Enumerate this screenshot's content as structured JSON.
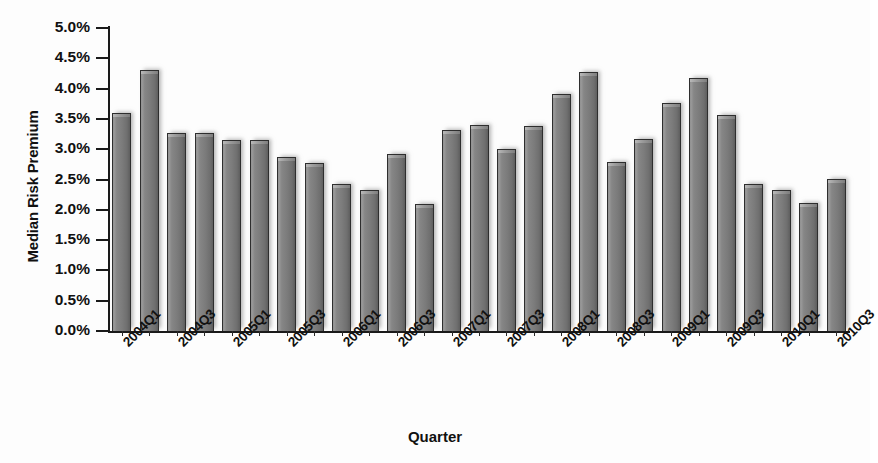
{
  "chart_data": {
    "type": "bar",
    "title": "",
    "xlabel": "Quarter",
    "ylabel": "Median Risk Premium",
    "ylim": [
      0.0,
      5.0
    ],
    "ytick_values": [
      0.0,
      0.5,
      1.0,
      1.5,
      2.0,
      2.5,
      3.0,
      3.5,
      4.0,
      4.5,
      5.0
    ],
    "ytick_labels": [
      "0.0%",
      "0.5%",
      "1.0%",
      "1.5%",
      "2.0%",
      "2.5%",
      "3.0%",
      "3.5%",
      "4.0%",
      "4.5%",
      "5.0%"
    ],
    "grid": false,
    "legend": false,
    "units": "percent",
    "categories": [
      "2004Q1",
      "2004Q2",
      "2004Q3",
      "2004Q4",
      "2005Q1",
      "2005Q2",
      "2005Q3",
      "2005Q4",
      "2006Q1",
      "2006Q2",
      "2006Q3",
      "2006Q4",
      "2007Q1",
      "2007Q2",
      "2007Q3",
      "2007Q4",
      "2008Q1",
      "2008Q2",
      "2008Q3",
      "2008Q4",
      "2009Q1",
      "2009Q2",
      "2009Q3",
      "2009Q4",
      "2010Q1",
      "2010Q2",
      "2010Q3"
    ],
    "values": [
      3.6,
      4.3,
      3.27,
      3.27,
      3.15,
      3.15,
      2.87,
      2.77,
      2.43,
      2.32,
      2.92,
      2.1,
      3.31,
      3.4,
      3.0,
      3.39,
      3.91,
      4.28,
      2.79,
      3.17,
      3.77,
      4.18,
      3.56,
      2.43,
      2.32,
      2.12,
      2.51
    ],
    "xtick_labels_shown": [
      "2004Q1",
      "2004Q3",
      "2005Q1",
      "2005Q3",
      "2006Q1",
      "2006Q3",
      "2007Q1",
      "2007Q3",
      "2008Q1",
      "2008Q3",
      "2009Q1",
      "2009Q3",
      "2010Q1",
      "2010Q3"
    ],
    "bar_color": "#7b7b7b",
    "bar_edge_color": "#2e2e2e",
    "axis_color": "#1a1a1a",
    "background_color": "#fdfdfd"
  }
}
